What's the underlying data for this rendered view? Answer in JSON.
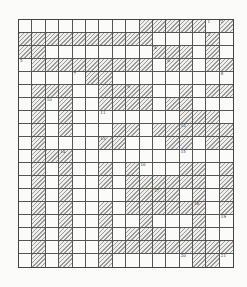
{
  "puzzle": {
    "cols": 16,
    "rows": 19,
    "cell_w": 13.4,
    "cell_h": 13.0,
    "hatch_color": "#9a9a98",
    "line_color": "#555555",
    "hatched": [
      "00000000011111010",
      "1111111111000010",
      "1100000000111010",
      "0111111111011011",
      "0000011000000000",
      "0111001111001011",
      "0101001111011000",
      "0101000000001110",
      "0101000110111111",
      "0100001100011011",
      "0111000000000000",
      "0101001010001101",
      "0101001011111101",
      "0101000011110101",
      "0101001011111101",
      "0101001001000100",
      "0101001011101100",
      "0101001111111111",
      "0101001000000110"
    ],
    "numbers": [
      {
        "r": 0,
        "c": 14,
        "n": "1"
      },
      {
        "r": 0,
        "c": 15,
        "n": "2"
      },
      {
        "r": 1,
        "c": 14,
        "n": "3"
      },
      {
        "r": 2,
        "c": 10,
        "n": "4"
      },
      {
        "r": 3,
        "c": 0,
        "n": "5"
      },
      {
        "r": 3,
        "c": 11,
        "n": "6"
      },
      {
        "r": 4,
        "c": 4,
        "n": "7"
      },
      {
        "r": 4,
        "c": 15,
        "n": "8"
      },
      {
        "r": 5,
        "c": 8,
        "n": "9"
      },
      {
        "r": 6,
        "c": 2,
        "n": "10"
      },
      {
        "r": 7,
        "c": 6,
        "n": "11"
      },
      {
        "r": 8,
        "c": 12,
        "n": "12"
      },
      {
        "r": 9,
        "c": 6,
        "n": "13"
      },
      {
        "r": 10,
        "c": 3,
        "n": "14"
      },
      {
        "r": 10,
        "c": 12,
        "n": "15"
      },
      {
        "r": 11,
        "c": 9,
        "n": "16"
      },
      {
        "r": 13,
        "c": 10,
        "n": "17"
      },
      {
        "r": 14,
        "c": 13,
        "n": "18"
      },
      {
        "r": 15,
        "c": 15,
        "n": "19"
      },
      {
        "r": 18,
        "c": 12,
        "n": "20"
      },
      {
        "r": 18,
        "c": 15,
        "n": "21"
      }
    ]
  }
}
